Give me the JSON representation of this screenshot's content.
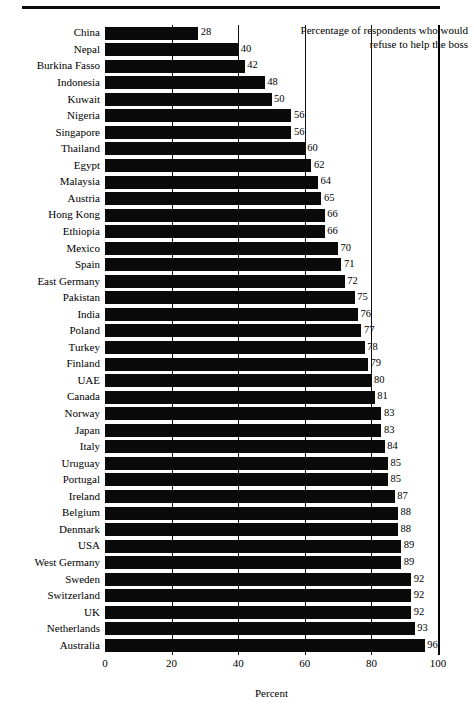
{
  "annotation": {
    "line1": "Percentage of respondents who would",
    "line2": "refuse to help the boss"
  },
  "axis": {
    "x_title": "Percent",
    "ticks": [
      "0",
      "20",
      "40",
      "60",
      "80",
      "100"
    ]
  },
  "chart_data": {
    "type": "bar",
    "orientation": "horizontal",
    "title": "",
    "subtitle": "",
    "annotation": "Percentage of respondents who would refuse to help the boss",
    "xlabel": "Percent",
    "ylabel": "",
    "xlim": [
      0,
      100
    ],
    "xticks": [
      0,
      20,
      40,
      60,
      80,
      100
    ],
    "grid": "vertical",
    "legend": "none",
    "bar_color": "#0a0a0a",
    "value_labels": true,
    "categories": [
      "China",
      "Nepal",
      "Burkina Fasso",
      "Indonesia",
      "Kuwait",
      "Nigeria",
      "Singapore",
      "Thailand",
      "Egypt",
      "Malaysia",
      "Austria",
      "Hong Kong",
      "Ethiopia",
      "Mexico",
      "Spain",
      "East Germany",
      "Pakistan",
      "India",
      "Poland",
      "Turkey",
      "Finland",
      "UAE",
      "Canada",
      "Norway",
      "Japan",
      "Italy",
      "Uruguay",
      "Portugal",
      "Ireland",
      "Belgium",
      "Denmark",
      "USA",
      "West Germany",
      "Sweden",
      "Switzerland",
      "UK",
      "Netherlands",
      "Australia"
    ],
    "values": [
      28,
      40,
      42,
      48,
      50,
      56,
      56,
      60,
      62,
      64,
      65,
      66,
      66,
      70,
      71,
      72,
      75,
      76,
      77,
      78,
      79,
      80,
      81,
      83,
      83,
      84,
      85,
      85,
      87,
      88,
      88,
      89,
      89,
      92,
      92,
      92,
      93,
      96
    ]
  }
}
